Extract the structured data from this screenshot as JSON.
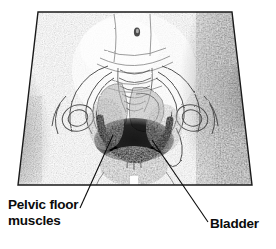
{
  "figure": {
    "type": "anatomical-illustration",
    "style": "grayscale halftone line drawing",
    "background_color": "#ffffff",
    "ink_color": "#111111",
    "frame": {
      "top_left_x": 38,
      "top_right_x": 232,
      "bottom_left_x": 18,
      "bottom_right_x": 252,
      "top_y": 12,
      "bottom_y": 185
    },
    "parts": [
      {
        "name": "torso-outline",
        "note": "trapezoid, wider at hips"
      },
      {
        "name": "navel",
        "x": 137,
        "y": 32
      },
      {
        "name": "sacrum-coccyx",
        "note": "central vertebral outlines"
      },
      {
        "name": "hip-bone-left"
      },
      {
        "name": "hip-bone-right"
      },
      {
        "name": "bladder",
        "note": "light rounded mass above pelvic floor"
      },
      {
        "name": "pelvic-floor-muscles",
        "note": "dark hammock-shaped band"
      },
      {
        "name": "right-edge-shadow",
        "note": "heavy dark shading"
      }
    ]
  },
  "labels": [
    {
      "id": "pelvic-floor-muscles",
      "line1": "Pelvic floor",
      "line2": "muscles",
      "text_x": 8,
      "text_y": 197,
      "leader": {
        "x1": 113,
        "y1": 135,
        "x2": 80,
        "y2": 208
      }
    },
    {
      "id": "bladder",
      "line1": "Bladder",
      "line2": "",
      "text_x": 210,
      "text_y": 216,
      "leader": {
        "x1": 152,
        "y1": 140,
        "x2": 208,
        "y2": 222
      }
    }
  ],
  "text": {
    "pelvic_line1": "Pelvic floor",
    "pelvic_line2": "muscles",
    "bladder": "Bladder"
  }
}
